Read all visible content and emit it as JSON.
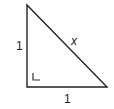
{
  "diagram": {
    "type": "right-triangle",
    "labels": {
      "left_side": "1",
      "bottom_side": "1",
      "hypotenuse": "x"
    },
    "right_angle_marker": "L",
    "colors": {
      "stroke": "#222222",
      "background": "#ffffff"
    }
  }
}
